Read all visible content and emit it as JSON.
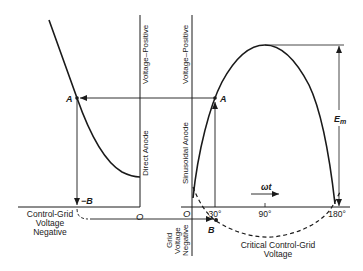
{
  "diagram": {
    "left_panel": {
      "vertical_axis_labels": {
        "upper": "Voltage–Positive",
        "lower": "Direct Anode"
      },
      "horizontal_axis_label": [
        "Control-Grid",
        "Voltage",
        "Negative"
      ],
      "origin": "O",
      "point_a": "A",
      "point_neg_b": "−B"
    },
    "right_panel": {
      "vertical_axis_labels": {
        "upper": "Voltage–Positive",
        "lower": "Sinusoidal Anode",
        "negative": [
          "Grid",
          "Voltage",
          "Negative"
        ]
      },
      "origin": "O",
      "point_a": "A",
      "point_b": "B",
      "ticks": [
        "30°",
        "90°",
        "180°"
      ],
      "omega_t": "ωt",
      "amplitude": "E",
      "amplitude_sub": "m",
      "dashed_curve_label": [
        "Critical Control-Grid",
        "Voltage"
      ]
    }
  }
}
